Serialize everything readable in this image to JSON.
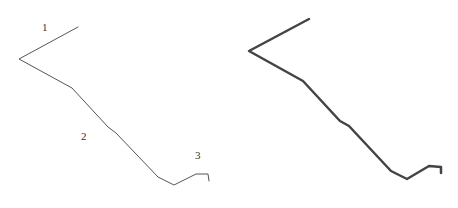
{
  "figure": {
    "left_panel": {
      "labels": [
        {
          "text": "1",
          "x": 42,
          "y": 31
        },
        {
          "text": "2",
          "x": 81,
          "y": 140
        },
        {
          "text": "3",
          "x": 195,
          "y": 159
        }
      ],
      "polyline": "78,27 19,59 72,88 108,127 116,133 158,177 174,185 196,174 208,174 209,181",
      "stroke": "#555555",
      "stroke_width": 1
    },
    "right_panel": {
      "polyline": "309,19 249,51 303,81 340,121 349,126 391,171 407,179 429,166 441,167 441,173",
      "stroke": "#444444",
      "stroke_width": 2.5
    }
  }
}
